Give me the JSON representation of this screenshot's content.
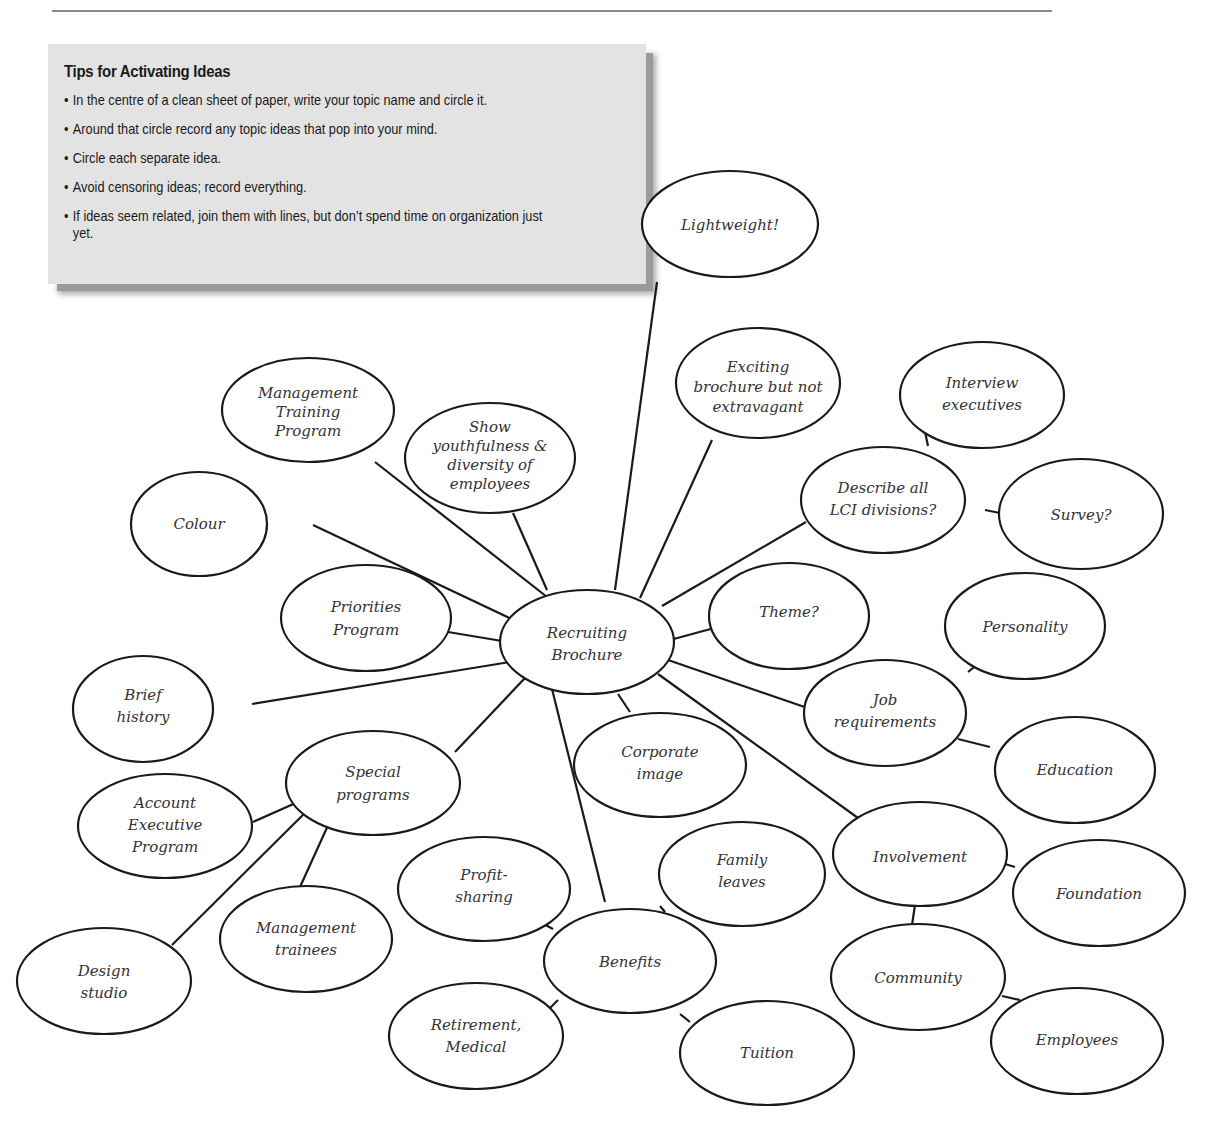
{
  "tips": {
    "title": "Tips for Activating Ideas",
    "items": [
      "In the centre of a clean sheet of paper, write your topic name and circle it.",
      "Around that circle record any topic ideas that pop into your mind.",
      "Circle each separate idea.",
      "Avoid censoring ideas; record everything.",
      "If ideas seem related, join them with lines, but don’t spend time on organization just yet."
    ]
  },
  "mindmap": {
    "center": {
      "id": "recruiting-brochure",
      "lines": [
        "Recruiting",
        "Brochure"
      ]
    },
    "nodes": [
      {
        "id": "lightweight",
        "lines": [
          "Lightweight!"
        ]
      },
      {
        "id": "exciting-brochure",
        "lines": [
          "Exciting",
          "brochure but not",
          "extravagant"
        ]
      },
      {
        "id": "interview-executives",
        "lines": [
          "Interview",
          "executives"
        ]
      },
      {
        "id": "describe-lci-divisions",
        "lines": [
          "Describe all",
          "LCI divisions?"
        ]
      },
      {
        "id": "survey",
        "lines": [
          "Survey?"
        ]
      },
      {
        "id": "management-training-program",
        "lines": [
          "Management",
          "Training",
          "Program"
        ]
      },
      {
        "id": "show-youthfulness",
        "lines": [
          "Show",
          "youthfulness &",
          "diversity of",
          "employees"
        ]
      },
      {
        "id": "colour",
        "lines": [
          "Colour"
        ]
      },
      {
        "id": "priorities-program",
        "lines": [
          "Priorities",
          "Program"
        ]
      },
      {
        "id": "theme",
        "lines": [
          "Theme?"
        ]
      },
      {
        "id": "personality",
        "lines": [
          "Personality"
        ]
      },
      {
        "id": "job-requirements",
        "lines": [
          "Job",
          "requirements"
        ]
      },
      {
        "id": "education",
        "lines": [
          "Education"
        ]
      },
      {
        "id": "brief-history",
        "lines": [
          "Brief",
          "history"
        ]
      },
      {
        "id": "special-programs",
        "lines": [
          "Special",
          "programs"
        ]
      },
      {
        "id": "corporate-image",
        "lines": [
          "Corporate",
          "image"
        ]
      },
      {
        "id": "account-executive-program",
        "lines": [
          "Account",
          "Executive",
          "Program"
        ]
      },
      {
        "id": "involvement",
        "lines": [
          "Involvement"
        ]
      },
      {
        "id": "foundation",
        "lines": [
          "Foundation"
        ]
      },
      {
        "id": "family-leaves",
        "lines": [
          "Family",
          "leaves"
        ]
      },
      {
        "id": "profit-sharing",
        "lines": [
          "Profit-",
          "sharing"
        ]
      },
      {
        "id": "management-trainees",
        "lines": [
          "Management",
          "trainees"
        ]
      },
      {
        "id": "design-studio",
        "lines": [
          "Design",
          "studio"
        ]
      },
      {
        "id": "benefits",
        "lines": [
          "Benefits"
        ]
      },
      {
        "id": "community",
        "lines": [
          "Community"
        ]
      },
      {
        "id": "retirement-medical",
        "lines": [
          "Retirement,",
          "Medical"
        ]
      },
      {
        "id": "tuition",
        "lines": [
          "Tuition"
        ]
      },
      {
        "id": "employees",
        "lines": [
          "Employees"
        ]
      }
    ]
  }
}
